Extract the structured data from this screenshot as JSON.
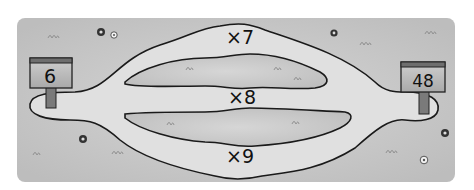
{
  "puzzle": {
    "start_value": "6",
    "end_value": "48",
    "paths": [
      {
        "label": "×7",
        "position": "top"
      },
      {
        "label": "×8",
        "position": "middle"
      },
      {
        "label": "×9",
        "position": "bottom"
      }
    ]
  },
  "colors": {
    "background": "#ffffff",
    "field": "#c9c9c9",
    "field_edge": "#b3b3b3",
    "path_fill": "#e2e2e2",
    "path_stroke": "#1a1a1a",
    "sign_board": "#bdbdbd",
    "sign_top": "#6e6e6e",
    "sign_post": "#7a7a7a"
  }
}
